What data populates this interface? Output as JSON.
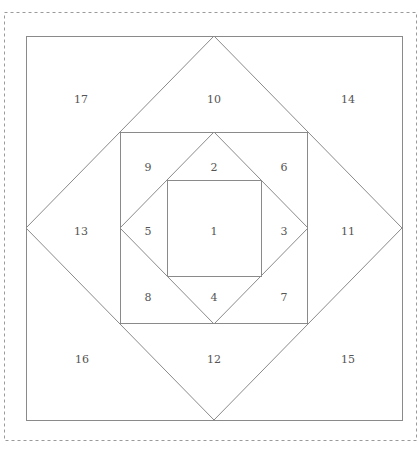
{
  "diagram": {
    "title": "",
    "type": "foundation paper piecing pattern",
    "colors": {
      "line": "#8a8a8a",
      "frame": "#9a9a9a",
      "label": "#555555",
      "background": "#ffffff"
    },
    "frame": {
      "x": 4,
      "y": 12,
      "w": 412,
      "h": 428
    },
    "shapes": {
      "outer_square": {
        "x": 26,
        "y": 36,
        "w": 376,
        "h": 384
      },
      "outer_diamond": "214,36 402,228 214,420 26,228",
      "middle_square": {
        "x": 120,
        "y": 132,
        "w": 187,
        "h": 191
      },
      "inner_diamond": "214,132 308,228 214,324 120,228",
      "inner_square": {
        "x": 167,
        "y": 180,
        "w": 94,
        "h": 96
      }
    },
    "pieces": [
      {
        "id": "1",
        "x": 214,
        "y": 232
      },
      {
        "id": "2",
        "x": 214,
        "y": 168
      },
      {
        "id": "3",
        "x": 284,
        "y": 232
      },
      {
        "id": "4",
        "x": 214,
        "y": 298
      },
      {
        "id": "5",
        "x": 148,
        "y": 232
      },
      {
        "id": "6",
        "x": 284,
        "y": 168
      },
      {
        "id": "7",
        "x": 284,
        "y": 298
      },
      {
        "id": "8",
        "x": 148,
        "y": 298
      },
      {
        "id": "9",
        "x": 148,
        "y": 168
      },
      {
        "id": "10",
        "x": 214,
        "y": 100
      },
      {
        "id": "11",
        "x": 348,
        "y": 232
      },
      {
        "id": "12",
        "x": 214,
        "y": 360
      },
      {
        "id": "13",
        "x": 81,
        "y": 232
      },
      {
        "id": "14",
        "x": 348,
        "y": 100
      },
      {
        "id": "15",
        "x": 348,
        "y": 360
      },
      {
        "id": "16",
        "x": 82,
        "y": 360
      },
      {
        "id": "17",
        "x": 81,
        "y": 100
      }
    ]
  }
}
